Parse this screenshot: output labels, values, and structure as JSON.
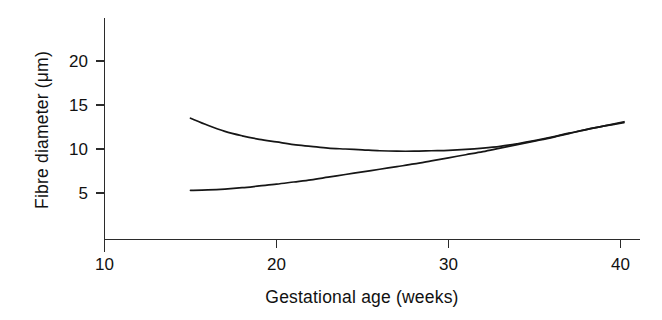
{
  "chart_data": {
    "type": "line",
    "title": "",
    "xlabel": "Gestational age (weeks)",
    "ylabel": "Fibre diameter (μm)",
    "xlim": [
      10,
      41
    ],
    "ylim": [
      0,
      23
    ],
    "xticks": [
      10,
      20,
      30,
      40
    ],
    "xticklabels": [
      "10",
      "20",
      "30",
      "40"
    ],
    "yticks": [
      5,
      10,
      15,
      20
    ],
    "yticklabels": [
      "5",
      "10",
      "15",
      "20"
    ],
    "grid": false,
    "legend": "none",
    "series": [
      {
        "name": "upper-curve",
        "x": [
          15.0,
          16.0,
          17.0,
          18.0,
          19.0,
          20.0,
          21.0,
          22.0,
          23.0,
          24.0,
          25.0,
          26.0,
          27.0,
          28.0,
          29.0,
          30.0,
          31.0,
          32.0,
          33.0,
          34.0,
          35.0,
          36.0,
          37.0,
          38.0,
          39.0,
          40.2
        ],
        "y": [
          13.5,
          12.7,
          12.0,
          11.5,
          11.1,
          10.8,
          10.5,
          10.3,
          10.1,
          10.0,
          9.9,
          9.8,
          9.75,
          9.75,
          9.8,
          9.85,
          9.95,
          10.1,
          10.3,
          10.6,
          10.95,
          11.35,
          11.8,
          12.2,
          12.6,
          13.0
        ]
      },
      {
        "name": "lower-curve",
        "x": [
          15.0,
          16.0,
          17.0,
          18.0,
          19.0,
          20.0,
          21.0,
          22.0,
          23.0,
          24.0,
          25.0,
          26.0,
          27.0,
          28.0,
          29.0,
          30.0,
          31.0,
          32.0,
          33.0,
          34.0,
          35.0,
          36.0,
          37.0,
          38.0,
          39.0,
          40.2
        ],
        "y": [
          5.3,
          5.35,
          5.45,
          5.6,
          5.8,
          6.0,
          6.25,
          6.5,
          6.8,
          7.1,
          7.4,
          7.7,
          8.0,
          8.3,
          8.65,
          9.0,
          9.35,
          9.7,
          10.1,
          10.5,
          10.9,
          11.3,
          11.75,
          12.2,
          12.6,
          13.1
        ]
      }
    ],
    "annotations": []
  },
  "axes": {
    "y_axis_label": "Fibre diameter (μm)",
    "x_axis_label": "Gestational age (weeks)",
    "y_tick_5": "5",
    "y_tick_10": "10",
    "y_tick_15": "15",
    "y_tick_20": "20",
    "x_tick_10": "10",
    "x_tick_20": "20",
    "x_tick_30": "30",
    "x_tick_40": "40"
  },
  "style": {
    "axis_color": "#2b2b2b",
    "curve_color": "#161616",
    "background": "#ffffff",
    "text_color": "#111111"
  }
}
